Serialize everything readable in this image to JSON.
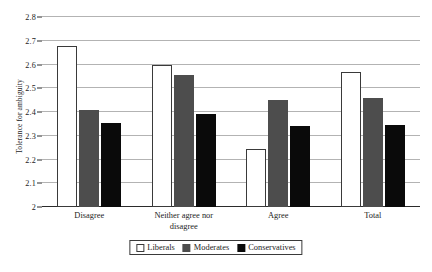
{
  "chart_data": {
    "type": "bar",
    "title": "",
    "xlabel": "",
    "ylabel": "Tolerance for ambiguity",
    "ylim": [
      2.0,
      2.8
    ],
    "yticks": [
      "2",
      "2.1",
      "2.2",
      "2.3",
      "2.4",
      "2.5",
      "2.6",
      "2.7",
      "2.8"
    ],
    "ytick_values": [
      2.0,
      2.1,
      2.2,
      2.3,
      2.4,
      2.5,
      2.6,
      2.7,
      2.8
    ],
    "grid": true,
    "legend_position": "bottom-center",
    "categories": [
      "Disagree",
      "Neither agree nor disagree",
      "Agree",
      "Total"
    ],
    "series": [
      {
        "name": "Liberals",
        "color": "#ffffff",
        "values": [
          2.68,
          2.6,
          2.245,
          2.57
        ]
      },
      {
        "name": "Moderates",
        "color": "#4d4d4d",
        "values": [
          2.41,
          2.555,
          2.45,
          2.46
        ]
      },
      {
        "name": "Conservatives",
        "color": "#0a0a0a",
        "values": [
          2.355,
          2.39,
          2.34,
          2.345
        ]
      }
    ]
  },
  "axes": {
    "y_title": "Tolerance for ambiguity"
  },
  "xlabels": [
    {
      "line1": "Disagree",
      "line2": ""
    },
    {
      "line1": "Neither agree nor",
      "line2": "disagree"
    },
    {
      "line1": "Agree",
      "line2": ""
    },
    {
      "line1": "Total",
      "line2": ""
    }
  ],
  "legend": {
    "items": [
      {
        "label": "Liberals",
        "swatch": "liberals"
      },
      {
        "label": "Moderates",
        "swatch": "moderates"
      },
      {
        "label": "Conservatives",
        "swatch": "conservatives"
      }
    ]
  },
  "yticks": [
    {
      "label": "2.8"
    },
    {
      "label": "2.7"
    },
    {
      "label": "2.6"
    },
    {
      "label": "2.5"
    },
    {
      "label": "2.4"
    },
    {
      "label": "2.3"
    },
    {
      "label": "2.2"
    },
    {
      "label": "2.1"
    },
    {
      "label": "2"
    }
  ]
}
